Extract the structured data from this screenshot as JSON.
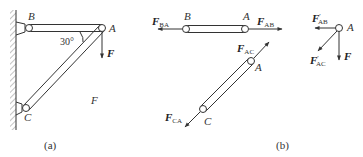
{
  "figure_a": {
    "caption": "(a)",
    "angle_label": "30°",
    "point_labels": {
      "B": "B",
      "A": "A",
      "C": "C"
    },
    "load_label": "F",
    "region_label": "F"
  },
  "figure_b": {
    "caption": "(b)",
    "rod_ab": {
      "left_force": {
        "main": "F",
        "sub": "BA"
      },
      "right_force": {
        "main": "F",
        "sub": "AB"
      },
      "left_point": "B",
      "right_point": "A"
    },
    "rod_ca": {
      "upper_force": {
        "main": "F",
        "sub": "AC"
      },
      "lower_force": {
        "main": "F",
        "sub": "CA"
      },
      "upper_point": "A",
      "lower_point": "C"
    },
    "node_a": {
      "point": "A",
      "force_ab": {
        "main": "F",
        "prime": "′",
        "sub": "AB"
      },
      "force_ac": {
        "main": "F",
        "prime": "′",
        "sub": "AC"
      },
      "load": "F"
    }
  },
  "colors": {
    "ink": "#333333",
    "background": "#ffffff"
  }
}
